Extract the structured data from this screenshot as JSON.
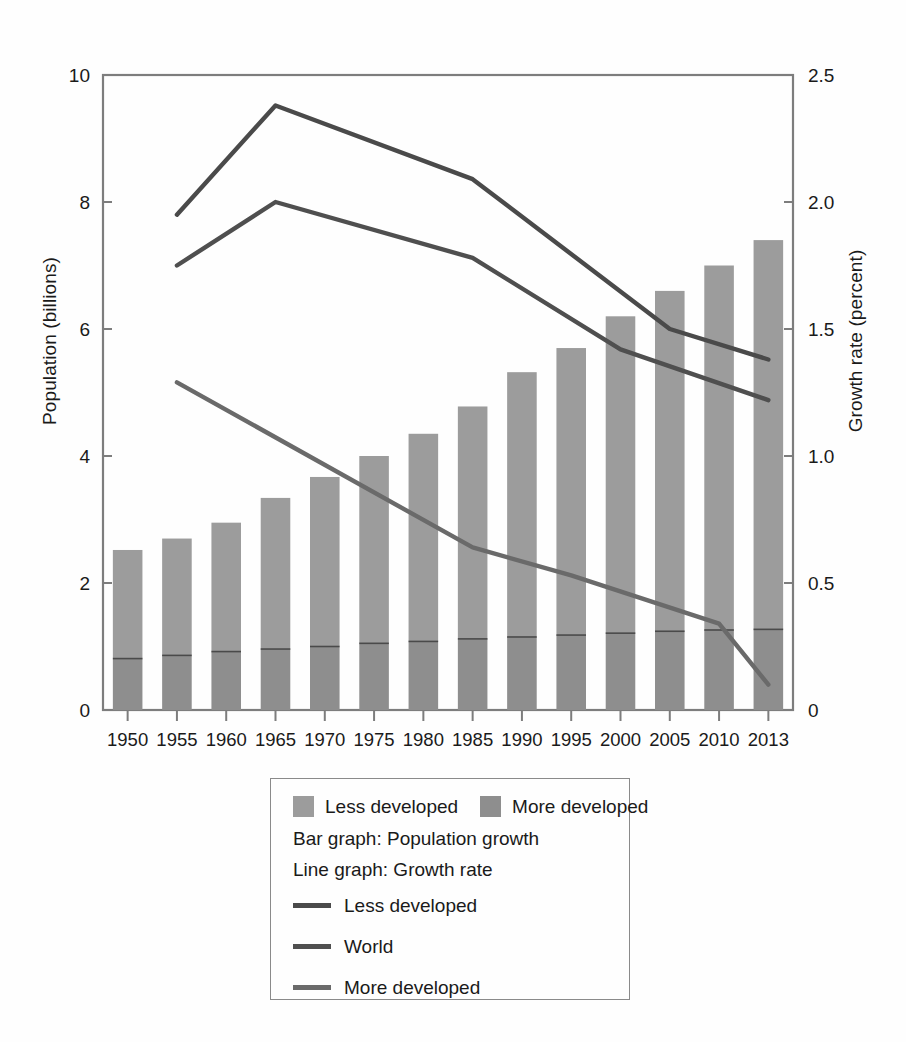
{
  "chart_data": {
    "type": "bar",
    "title": "",
    "subtitle": "",
    "xlabel": "",
    "ylabel": "Population (billions)",
    "ylabel_right": "Growth rate (percent)",
    "categories": [
      "1950",
      "1955",
      "1960",
      "1965",
      "1970",
      "1975",
      "1980",
      "1985",
      "1990",
      "1995",
      "2000",
      "2005",
      "2010",
      "2013"
    ],
    "ylim": [
      0,
      10
    ],
    "yticks": [
      "0",
      "2",
      "4",
      "6",
      "8",
      "10"
    ],
    "ytick_values": [
      0,
      2,
      4,
      6,
      8,
      10
    ],
    "ylim_right": [
      0,
      2.5
    ],
    "yticks_right": [
      "0",
      "0.5",
      "1.0",
      "1.5",
      "2.0",
      "2.5"
    ],
    "ytick_values_right": [
      0,
      0.5,
      1.0,
      1.5,
      2.0,
      2.5
    ],
    "grid": false,
    "legend_position": "below-center",
    "stacked": true,
    "bar_series": [
      {
        "name": "More developed",
        "axis": "left",
        "color": "#8e8e8e",
        "values": [
          0.81,
          0.86,
          0.92,
          0.96,
          1.0,
          1.05,
          1.08,
          1.12,
          1.15,
          1.18,
          1.21,
          1.24,
          1.26,
          1.27
        ]
      },
      {
        "name": "Less developed",
        "axis": "left",
        "color": "#9c9c9c",
        "values": [
          1.71,
          1.84,
          2.03,
          2.38,
          2.67,
          2.95,
          3.27,
          3.66,
          4.17,
          4.52,
          4.99,
          5.36,
          5.74,
          6.13
        ]
      }
    ],
    "bar_totals": [
      2.52,
      2.7,
      2.95,
      3.34,
      3.67,
      4.0,
      4.35,
      4.78,
      5.32,
      5.7,
      6.2,
      6.6,
      7.0,
      7.4
    ],
    "line_series": [
      {
        "name": "Less developed",
        "axis": "right",
        "color": "#4a4a4a",
        "x": [
          "1955",
          "1965",
          "1985",
          "2005",
          "2013"
        ],
        "values": [
          1.95,
          2.38,
          2.09,
          1.5,
          1.38
        ]
      },
      {
        "name": "World",
        "axis": "right",
        "color": "#4f4f4f",
        "x": [
          "1955",
          "1965",
          "1985",
          "2000",
          "2013"
        ],
        "values": [
          1.75,
          2.0,
          1.78,
          1.42,
          1.22
        ]
      },
      {
        "name": "More developed",
        "axis": "right",
        "color": "#6a6a6a",
        "x": [
          "1955",
          "1985",
          "1995",
          "2010",
          "2013"
        ],
        "values": [
          1.29,
          0.64,
          0.53,
          0.34,
          0.1
        ]
      }
    ]
  },
  "axes": {
    "left_title": "Population (billions)",
    "right_title": "Growth rate (percent)"
  },
  "legend": {
    "swatch_items": [
      {
        "label": "Less developed",
        "color": "#9c9c9c"
      },
      {
        "label": "More developed",
        "color": "#8e8e8e"
      }
    ],
    "notes": [
      "Bar graph: Population growth",
      "Line graph: Growth rate"
    ],
    "line_items": [
      {
        "label": "Less developed",
        "color": "#4a4a4a"
      },
      {
        "label": "World",
        "color": "#4f4f4f"
      },
      {
        "label": "More developed",
        "color": "#6a6a6a"
      }
    ]
  }
}
